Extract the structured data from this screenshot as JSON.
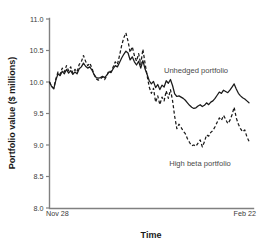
{
  "chart_data": {
    "type": "line",
    "title": "",
    "xlabel": "Time",
    "ylabel": "Portfolio value ($ millions)",
    "ylim": [
      8.0,
      11.0
    ],
    "yticks": [
      "11.0",
      "10.5",
      "10.0",
      "9.5",
      "9.0",
      "8.5",
      "8.0"
    ],
    "ytick_values": [
      11.0,
      10.5,
      10.0,
      9.5,
      9.0,
      8.5,
      8.0
    ],
    "xticks": [
      "Nov 28",
      "Feb 22"
    ],
    "xlim_labels": {
      "start": "Nov 28",
      "end": "Feb 22"
    },
    "grid": false,
    "legend_position": "inline-annotation",
    "annotations": [
      {
        "text": "Unhedged portfolio",
        "x": 196,
        "y": 71,
        "series": "unhedged"
      },
      {
        "text": "High beta portfolio",
        "x": 200,
        "y": 164,
        "series": "high_beta"
      }
    ],
    "series": [
      {
        "name": "Unhedged portfolio",
        "style": "solid",
        "color": "#1a1a1a",
        "values": [
          10.0,
          9.93,
          9.89,
          10.03,
          10.13,
          10.1,
          10.17,
          10.13,
          10.2,
          10.14,
          10.18,
          10.12,
          10.16,
          10.13,
          10.21,
          10.24,
          10.3,
          10.25,
          10.22,
          10.24,
          10.19,
          10.12,
          10.07,
          10.06,
          10.07,
          10.09,
          10.07,
          10.11,
          10.16,
          10.15,
          10.21,
          10.26,
          10.24,
          10.31,
          10.38,
          10.44,
          10.49,
          10.46,
          10.35,
          10.4,
          10.32,
          10.27,
          10.33,
          10.22,
          10.34,
          10.21,
          10.12,
          10.02,
          9.97,
          10.01,
          9.91,
          9.96,
          9.88,
          9.95,
          9.92,
          10.02,
          9.98,
          10.04,
          9.94,
          9.81,
          9.77,
          9.78,
          9.76,
          9.74,
          9.71,
          9.67,
          9.63,
          9.6,
          9.58,
          9.59,
          9.62,
          9.64,
          9.61,
          9.63,
          9.67,
          9.64,
          9.68,
          9.7,
          9.74,
          9.79,
          9.84,
          9.82,
          9.87,
          9.85,
          9.83,
          9.87,
          9.92,
          9.97,
          9.89,
          9.82,
          9.78,
          9.75,
          9.73,
          9.7,
          9.67
        ]
      },
      {
        "name": "High beta portfolio",
        "style": "dashed",
        "color": "#1a1a1a",
        "values": [
          10.0,
          9.93,
          9.9,
          10.05,
          10.16,
          10.12,
          10.22,
          10.16,
          10.26,
          10.18,
          10.24,
          10.14,
          10.2,
          10.16,
          10.28,
          10.32,
          10.42,
          10.33,
          10.26,
          10.3,
          10.22,
          10.12,
          10.05,
          10.03,
          10.05,
          10.08,
          10.04,
          10.1,
          10.18,
          10.16,
          10.24,
          10.32,
          10.28,
          10.42,
          10.58,
          10.7,
          10.78,
          10.65,
          10.47,
          10.56,
          10.42,
          10.33,
          10.45,
          10.28,
          10.52,
          10.3,
          10.1,
          9.92,
          9.82,
          9.9,
          9.68,
          9.78,
          9.64,
          9.76,
          9.7,
          9.86,
          9.74,
          9.88,
          9.7,
          9.45,
          9.26,
          9.33,
          9.28,
          9.22,
          9.18,
          9.1,
          9.04,
          8.99,
          9.0,
          8.98,
          9.03,
          9.08,
          8.97,
          9.05,
          9.16,
          9.14,
          9.2,
          9.23,
          9.29,
          9.36,
          9.43,
          9.39,
          9.47,
          9.41,
          9.34,
          9.39,
          9.48,
          9.6,
          9.43,
          9.33,
          9.26,
          9.21,
          9.24,
          9.13,
          9.06
        ]
      }
    ]
  },
  "axes": {
    "y_title": "Portfolio value ($ millions)",
    "x_title": "Time",
    "y_labels": [
      "11.0",
      "10.5",
      "10.0",
      "9.5",
      "9.0",
      "8.5",
      "8.0"
    ],
    "x_label_left": "Nov 28",
    "x_label_right": "Feb 22"
  },
  "labels": {
    "unhedged": "Unhedged portfolio",
    "high_beta": "High beta portfolio"
  },
  "colors": {
    "axis": "#808080",
    "line": "#1a1a1a",
    "tick_text": "#3a3a3a",
    "title_text": "#1a1a1a",
    "annotation_text": "#4a4a4a",
    "background": "#ffffff"
  }
}
